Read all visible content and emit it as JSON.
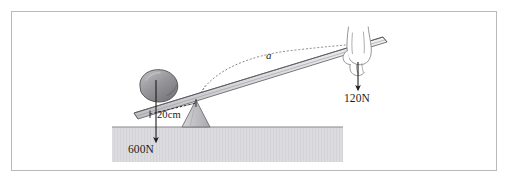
{
  "figure": {
    "kind": "physics-lever-diagram",
    "title_text": "",
    "frame": {
      "border_color": "#b9b9bc",
      "background": "#ffffff"
    }
  },
  "labels": {
    "load_force": "600N",
    "effort_force": "120N",
    "distance": "20cm",
    "angle": "a"
  },
  "elements": {
    "rock_name": "rock",
    "lever_name": "lever-bar",
    "fulcrum_name": "fulcrum",
    "hand_name": "hand",
    "ground_name": "ground",
    "arc_name": "angle-arc"
  },
  "colors": {
    "rock_fill": "#8e8e92",
    "rock_highlight": "#b3b3b6",
    "rock_outline": "#4d4d51",
    "fulcrum_fill": "#c9c9cc",
    "fulcrum_outline": "#6e6e72",
    "ground_fill": "#dcdcde",
    "ground_line": "#8a8a8d",
    "bar_fill": "#e3e3e5",
    "bar_outline": "#6a6a6e",
    "arrow": "#1c1c1c",
    "dotted": "#7b7b7f",
    "hand_outline": "#8a8a8e",
    "text": "#1c1c1c"
  }
}
